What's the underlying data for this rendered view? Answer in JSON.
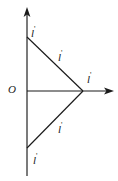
{
  "figure": {
    "background_color": "#ffffff",
    "stroke_color": "#1a1a1a",
    "width": 118,
    "height": 181
  },
  "axes": {
    "origin_label": "O",
    "vertical": {
      "name": "vertical-axis",
      "x": 27,
      "y_top": 8,
      "y_bottom": 176,
      "arrow_at": "top"
    },
    "horizontal": {
      "name": "horizontal-axis",
      "y": 91,
      "x_left": 27,
      "x_right": 113,
      "arrow_at": "right"
    }
  },
  "points": {
    "origin": {
      "label": "O",
      "x": 27,
      "y": 91
    },
    "top_vertex": {
      "label": "l",
      "prime": "'",
      "x": 27,
      "y": 37
    },
    "bottom_vertex": {
      "label": "l",
      "prime": "'",
      "x": 27,
      "y": 148
    },
    "right_vertex": {
      "label": "l",
      "prime": "'",
      "x": 83,
      "y": 91
    }
  },
  "segments": [
    {
      "name": "upper-hypotenuse",
      "label": "l",
      "prime": "'",
      "from": {
        "x": 27,
        "y": 37
      },
      "to": {
        "x": 83,
        "y": 91
      }
    },
    {
      "name": "lower-hypotenuse",
      "label": "l",
      "prime": "'",
      "from": {
        "x": 27,
        "y": 148
      },
      "to": {
        "x": 83,
        "y": 91
      }
    }
  ],
  "labels": {
    "origin": "O",
    "top_vertex": "l",
    "top_vertex_prime": "'",
    "bottom_vertex": "l",
    "bottom_vertex_prime": "'",
    "right_vertex": "l",
    "right_vertex_prime": "'",
    "upper_segment": "l",
    "upper_segment_prime": "'",
    "lower_segment": "l",
    "lower_segment_prime": "'"
  }
}
